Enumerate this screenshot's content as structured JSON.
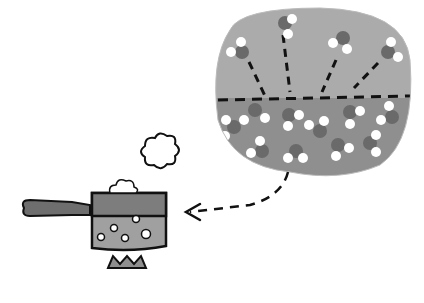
{
  "illustration": {
    "subject": "evaporation of water from a boiling saucepan",
    "colors": {
      "background": "#ffffff",
      "bubble_air": "#a9a9a9",
      "bubble_water": "#8f8f8f",
      "molecule_dark": "#6a6a6a",
      "molecule_light": "#ffffff",
      "pan_body": "#a0a0a0",
      "pan_rim": "#7d7d7d",
      "handle": "#6e6e6e",
      "outline": "#111111"
    }
  }
}
